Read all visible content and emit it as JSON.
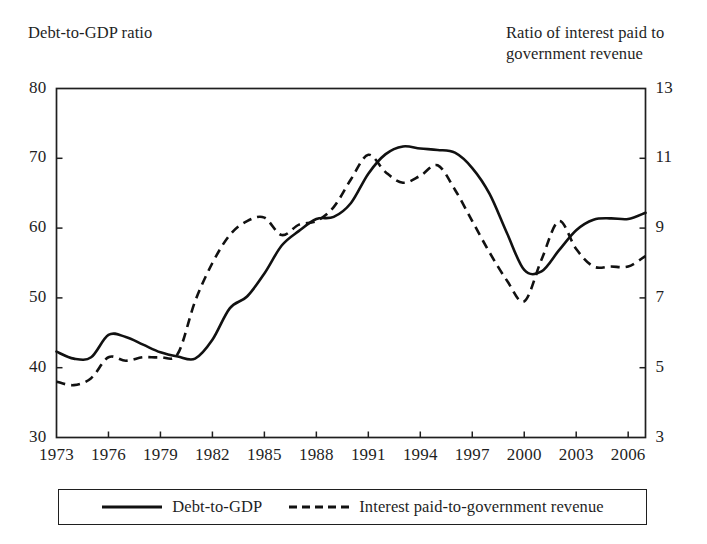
{
  "chart_data": {
    "type": "line",
    "title": "",
    "subtitle": "",
    "xlabel": "",
    "ylabel": "Debt-to-GDP ratio",
    "y2label": "Ratio of interest paid to government revenue",
    "axis_captions": {
      "left": "Debt-to-GDP ratio",
      "right_line1": "Ratio of interest paid to",
      "right_line2": "government revenue"
    },
    "grid": false,
    "legend_position": "bottom",
    "xlim": [
      1973,
      2007
    ],
    "ylim": [
      30,
      80
    ],
    "y2lim": [
      3,
      13
    ],
    "x_ticks": [
      1973,
      1976,
      1979,
      1982,
      1985,
      1988,
      1991,
      1994,
      1997,
      2000,
      2003,
      2006
    ],
    "x_tick_labels": [
      "1973",
      "1976",
      "1979",
      "1982",
      "1985",
      "1988",
      "1991",
      "1994",
      "1997",
      "2000",
      "2003",
      "2006"
    ],
    "y_ticks": [
      30,
      40,
      50,
      60,
      70,
      80
    ],
    "y_tick_labels": [
      "30",
      "40",
      "50",
      "60",
      "70",
      "80"
    ],
    "y2_ticks": [
      3,
      5,
      7,
      9,
      11,
      13
    ],
    "y2_tick_labels": [
      "3",
      "5",
      "7",
      "9",
      "11",
      "13"
    ],
    "x": [
      1973,
      1974,
      1975,
      1976,
      1977,
      1978,
      1979,
      1980,
      1981,
      1982,
      1983,
      1984,
      1985,
      1986,
      1987,
      1988,
      1989,
      1990,
      1991,
      1992,
      1993,
      1994,
      1995,
      1996,
      1997,
      1998,
      1999,
      2000,
      2001,
      2002,
      2003,
      2004,
      2005,
      2006,
      2007
    ],
    "series": [
      {
        "name": "Debt-to-GDP",
        "axis": "left",
        "style": "solid",
        "color": "#111111",
        "values": [
          42.3,
          41.3,
          41.5,
          44.7,
          44.4,
          43.3,
          42.2,
          41.6,
          41.3,
          44.0,
          48.5,
          50.2,
          53.5,
          57.5,
          59.6,
          61.3,
          61.6,
          63.6,
          67.8,
          70.6,
          71.7,
          71.4,
          71.2,
          70.8,
          68.6,
          64.9,
          59.3,
          54.0,
          53.8,
          56.8,
          59.7,
          61.2,
          61.4,
          61.3,
          62.2
        ]
      },
      {
        "name": "Interest paid-to-government revenue",
        "axis": "right",
        "style": "dashed",
        "color": "#111111",
        "values": [
          4.6,
          4.5,
          4.7,
          5.3,
          5.2,
          5.3,
          5.3,
          5.4,
          6.9,
          8.0,
          8.8,
          9.2,
          9.3,
          8.8,
          9.1,
          9.2,
          9.6,
          10.4,
          11.1,
          10.6,
          10.3,
          10.5,
          10.8,
          10.1,
          9.2,
          8.3,
          7.5,
          6.9,
          8.1,
          9.2,
          8.4,
          7.9,
          7.9,
          7.9,
          8.2
        ]
      }
    ],
    "legend": [
      {
        "label": "Debt-to-GDP",
        "style": "solid"
      },
      {
        "label": "Interest paid-to-government revenue",
        "style": "dashed"
      }
    ]
  }
}
